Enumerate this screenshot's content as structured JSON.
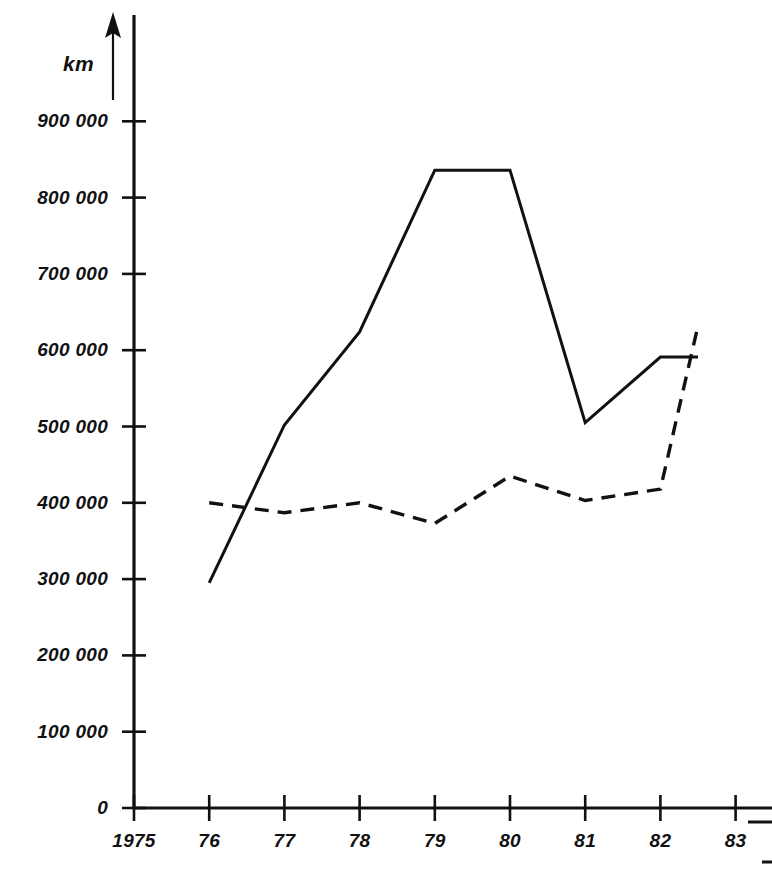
{
  "chart_data": {
    "type": "line",
    "title": "",
    "subtitle": "",
    "xlabel": "",
    "ylabel": "km",
    "y_unit_label": "km",
    "x": [
      1976,
      1977,
      1978,
      1979,
      1980,
      1981,
      1982,
      1982.5
    ],
    "x_tick_labels": [
      "1975",
      "76",
      "77",
      "78",
      "79",
      "80",
      "81",
      "82",
      "83"
    ],
    "x_tick_values": [
      1975,
      1976,
      1977,
      1978,
      1979,
      1980,
      1981,
      1982,
      1983
    ],
    "y_tick_labels": [
      "0",
      "100 000",
      "200 000",
      "300 000",
      "400 000",
      "500 000",
      "600 000",
      "700 000",
      "800 000",
      "900 000"
    ],
    "y_tick_values": [
      0,
      100000,
      200000,
      300000,
      400000,
      500000,
      600000,
      700000,
      800000,
      900000
    ],
    "xlim": [
      1975,
      1983.6
    ],
    "ylim": [
      0,
      950000
    ],
    "grid": false,
    "legend": "none",
    "series": [
      {
        "name": "solid-series",
        "style": "solid",
        "x": [
          1976,
          1977,
          1978,
          1979,
          1980,
          1981,
          1982,
          1982.5
        ],
        "values": [
          295000,
          502000,
          624000,
          836000,
          836000,
          505000,
          591000,
          591000
        ]
      },
      {
        "name": "dashed-series",
        "style": "dashed",
        "x": [
          1976,
          1977,
          1978,
          1979,
          1980,
          1981,
          1982,
          1982.5
        ],
        "values": [
          400000,
          387000,
          400000,
          373000,
          435000,
          403000,
          418000,
          632000
        ]
      }
    ],
    "annotations": []
  },
  "axes": {
    "y_unit": "km",
    "y_ticks": [
      {
        "label": "900 000",
        "value": 900000
      },
      {
        "label": "800 000",
        "value": 800000
      },
      {
        "label": "700 000",
        "value": 700000
      },
      {
        "label": "600 000",
        "value": 600000
      },
      {
        "label": "500 000",
        "value": 500000
      },
      {
        "label": "400 000",
        "value": 400000
      },
      {
        "label": "300 000",
        "value": 300000
      },
      {
        "label": "200 000",
        "value": 200000
      },
      {
        "label": "100 000",
        "value": 100000
      },
      {
        "label": "0",
        "value": 0
      }
    ],
    "x_ticks": [
      {
        "label": "1975",
        "value": 1975
      },
      {
        "label": "76",
        "value": 1976
      },
      {
        "label": "77",
        "value": 1977
      },
      {
        "label": "78",
        "value": 1978
      },
      {
        "label": "79",
        "value": 1979
      },
      {
        "label": "80",
        "value": 1980
      },
      {
        "label": "81",
        "value": 1981
      },
      {
        "label": "82",
        "value": 1982
      },
      {
        "label": "83",
        "value": 1983
      }
    ]
  },
  "geometry": {
    "origin_x": 134,
    "origin_y": 808,
    "px_per_year": 75.2,
    "px_per_100k": 76.3,
    "axis_top_y": 15,
    "axis_right_x": 772
  },
  "colors": {
    "ink": "#111111",
    "background": "#ffffff"
  }
}
